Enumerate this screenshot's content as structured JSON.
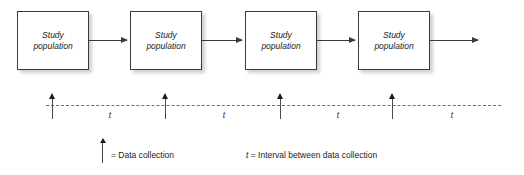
{
  "diagram": {
    "colors": {
      "box_border": "#3a3a3a",
      "box_fill": "#ffffff",
      "arrow": "#3a3a3a",
      "timeline_dash": "#6e6e6e",
      "tick": "#1b1b1b",
      "text": "#1b1b1b"
    },
    "boxes": [
      {
        "label": "Study\npopulation"
      },
      {
        "label": "Study\npopulation"
      },
      {
        "label": "Study\npopulation"
      },
      {
        "label": "Study\npopulation"
      }
    ],
    "flow_arrows": [
      {
        "name": "arrow-box1-to-box2"
      },
      {
        "name": "arrow-box2-to-box3"
      },
      {
        "name": "arrow-box3-to-box4"
      },
      {
        "name": "arrow-box4-to-future"
      }
    ],
    "timeline": {
      "tick_count": 4,
      "ticks": [
        {
          "name": "data-collection-tick-1"
        },
        {
          "name": "data-collection-tick-2"
        },
        {
          "name": "data-collection-tick-3"
        },
        {
          "name": "data-collection-tick-4"
        }
      ],
      "interval_labels": [
        "t",
        "t",
        "t",
        "t"
      ]
    },
    "legend": {
      "data_collection": {
        "icon": "up-arrow-icon",
        "text": "= Data collection"
      },
      "interval": {
        "symbol": "t",
        "text": " = Interval between data collection"
      }
    }
  }
}
